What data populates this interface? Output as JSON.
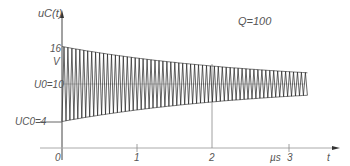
{
  "chart_data": {
    "type": "line",
    "xlabel": "t",
    "ylabel": "u_C(t)",
    "x_unit": "µs",
    "y_unit": "V",
    "x_ticks": [
      "0",
      "1",
      "2",
      "3"
    ],
    "y_annotations": [
      {
        "label": "16",
        "value": 16
      },
      {
        "label": "U0 = 10",
        "value": 10
      },
      {
        "label": "UC0 = 4",
        "value": 4
      }
    ],
    "xlim": [
      0,
      3.6
    ],
    "ylim": [
      0,
      18
    ],
    "series": [
      {
        "name": "u_C(t) damped oscillation",
        "description": "Oscillation about U0=10 V; envelope decays from 16/4 V at t=0 toward ~12/8 V at t≈3.2 µs",
        "x_start": 0,
        "x_end": 3.25,
        "center": 10,
        "initial_amplitude": 6,
        "final_amplitude": 1.8,
        "cycles": 62
      }
    ],
    "grid": false,
    "vertical_marker_x": 2
  },
  "labels": {
    "y_axis": "uC(t)",
    "y_top_value": "16",
    "y_unit": "V",
    "u0": "U0=10",
    "uc0": "UC0=4",
    "q": "Q=100",
    "x0": "0",
    "x1": "1",
    "x2": "2",
    "x3": "3",
    "x_unit": "µs",
    "x_axis": "t"
  }
}
